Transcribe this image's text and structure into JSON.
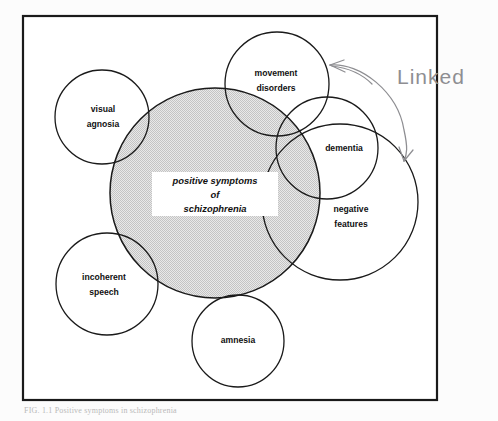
{
  "figure": {
    "border_color": "#1a1a1a",
    "shade_color": "#d7d7d7",
    "stroke_color": "#1a1a1a",
    "annotation_color": "#8e8e92",
    "background_color": "#fcfcfc"
  },
  "center": {
    "label_line1": "positive symptoms",
    "label_line2": "of",
    "label_line3": "schizophrenia"
  },
  "circles": [
    {
      "id": "positive-symptoms",
      "label": "positive symptoms of schizophrenia",
      "shaded": true,
      "cx": 215,
      "cy": 193,
      "r": 105
    },
    {
      "id": "visual-agnosia",
      "label_line1": "visual",
      "label_line2": "agnosia",
      "shaded": false,
      "cx": 102,
      "cy": 117,
      "r": 47
    },
    {
      "id": "movement-disorders",
      "label_line1": "movement",
      "label_line2": "disorders",
      "shaded": false,
      "cx": 277,
      "cy": 84,
      "r": 52
    },
    {
      "id": "dementia",
      "label_line1": "dementia",
      "label_line2": "",
      "shaded": false,
      "cx": 327,
      "cy": 148,
      "r": 51
    },
    {
      "id": "negative-features",
      "label_line1": "negative",
      "label_line2": "features",
      "shaded": false,
      "cx": 340,
      "cy": 202,
      "r": 78
    },
    {
      "id": "incoherent-speech",
      "label_line1": "incoherent",
      "label_line2": "speech",
      "shaded": false,
      "cx": 107,
      "cy": 284,
      "r": 51
    },
    {
      "id": "amnesia",
      "label_line1": "amnesia",
      "label_line2": "",
      "shaded": false,
      "cx": 238,
      "cy": 341,
      "r": 46
    }
  ],
  "annotation": {
    "text": "Linked",
    "type": "handwritten",
    "arrow_targets": [
      "movement-disorders",
      "negative-features"
    ]
  },
  "caption": {
    "text": "FIG. 1.1 Positive symptoms in schizophrenia"
  }
}
